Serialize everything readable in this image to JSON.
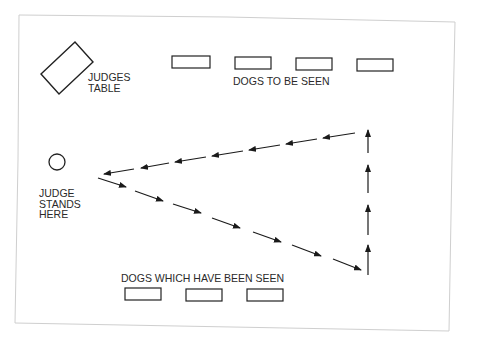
{
  "diagram": {
    "labels": {
      "judges_table": [
        "JUDGES",
        "TABLE"
      ],
      "dogs_to_be_seen": "DOGS TO BE SEEN",
      "judge_stands_here": [
        "JUDGE",
        "STANDS",
        "HERE"
      ],
      "dogs_which_have_been_seen": "DOGS WHICH HAVE BEEN SEEN"
    },
    "elements": {
      "judges_table": "rotated rectangle",
      "judge_position": "circle",
      "dogs_to_be_seen_count": 4,
      "dogs_seen_count": 3
    },
    "path": {
      "description": "Dashed triangle: from judge diagonally down-right to bottom-right corner, up the right side, then back left to the judge",
      "legs": [
        "down-right diagonal",
        "up vertical",
        "left diagonal back to judge"
      ]
    },
    "colors": {
      "line": "#1a1a1a",
      "border": "#cfcfcf",
      "background": "#ffffff"
    }
  }
}
